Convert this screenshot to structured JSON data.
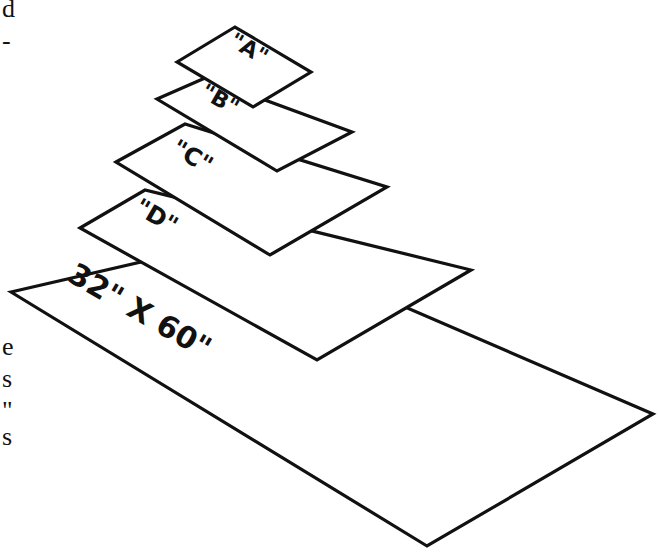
{
  "margin_text_fragments": [
    {
      "text": "d",
      "x": 2,
      "y": 0
    },
    {
      "text": "-",
      "x": 2,
      "y": 32
    },
    {
      "text": "e",
      "x": 2,
      "y": 338
    },
    {
      "text": "s",
      "x": 2,
      "y": 370
    },
    {
      "text": "\"",
      "x": 2,
      "y": 402
    },
    {
      "text": "s",
      "x": 2,
      "y": 428
    }
  ],
  "panels": [
    {
      "id": "base",
      "label": "32\" X 60\"",
      "points": "11,292 245,238 653,414 427,546"
    },
    {
      "id": "D",
      "label": "\"D\"",
      "points": "80,228 145,190 471,270 317,360"
    },
    {
      "id": "C",
      "label": "\"C\"",
      "points": "116,162 185,124 387,187 270,255"
    },
    {
      "id": "B",
      "label": "\"B\"",
      "points": "157,99 205,78 352,132 277,171"
    },
    {
      "id": "A",
      "label": "\"A\"",
      "points": "177,62 235,27 311,72 253,107"
    }
  ],
  "colors": {
    "stroke": "#111111",
    "fill": "#ffffff"
  }
}
